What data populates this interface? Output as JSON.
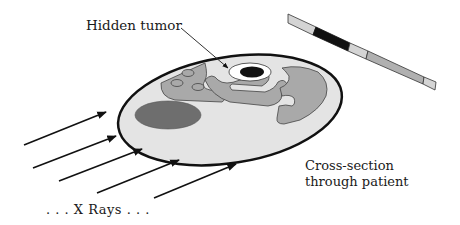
{
  "diagram": {
    "labels": {
      "tumor": "Hidden tumor",
      "cross_section_line1": "Cross-section",
      "cross_section_line2": "through patient",
      "xrays": ". . .   X Rays . . ."
    },
    "colors": {
      "outline": "#111111",
      "body_fill": "#e4e4e4",
      "organ_fill": "#a9a9a9",
      "dark_organ_fill": "#6e6e6e",
      "tumor_ring": "#ffffff",
      "tumor_core": "#111111",
      "strip_light": "#d4d4d4",
      "strip_mid": "#b0b0b0",
      "strip_dark": "#111111"
    },
    "detector_strip": {
      "segments": [
        "light",
        "dark",
        "light",
        "mid",
        "light"
      ]
    },
    "arrow_count": 5
  }
}
